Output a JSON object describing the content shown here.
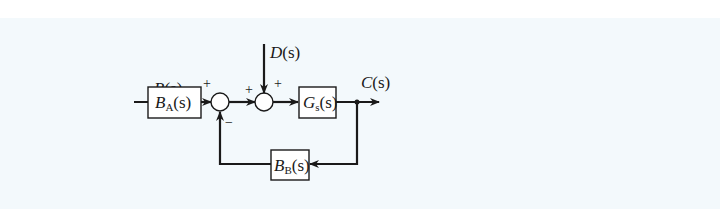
{
  "diagram": {
    "type": "block-diagram",
    "colors": {
      "background_top": "#ffffff",
      "panel": "#f3f9fc",
      "stroke": "#1a1a1a",
      "box_fill": "#ffffff"
    },
    "signals": {
      "input": {
        "sym": "R",
        "arg": "(s)"
      },
      "disturbance": {
        "sym": "D",
        "arg": "(s)"
      },
      "output": {
        "sym": "C",
        "arg": "(s)"
      }
    },
    "blocks": {
      "ba": {
        "sym": "B",
        "sub": "A",
        "arg": "(s)"
      },
      "gs": {
        "sym": "G",
        "sub": "s",
        "arg": "(s)"
      },
      "bb": {
        "sym": "B",
        "sub": "B",
        "arg": "(s)"
      }
    },
    "summing_junctions": {
      "sum1": {
        "sign_left": "+",
        "sign_bottom": "−"
      },
      "sum2": {
        "sign_left": "+",
        "sign_top": "+"
      }
    },
    "connections": [
      "R(s) -> B_A(s)",
      "B_A(s) -> sum1 (+)",
      "sum1 -> sum2 (+)",
      "D(s) -> sum2 (+)",
      "sum2 -> G_s(s)",
      "G_s(s) -> C(s)",
      "C(s) -> B_B(s)",
      "B_B(s) -> sum1 (−)"
    ]
  }
}
